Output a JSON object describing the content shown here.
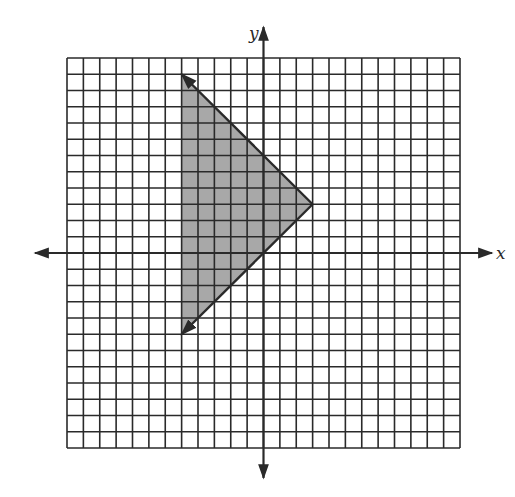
{
  "chart_data": {
    "type": "inequality-region",
    "title": "",
    "xlabel": "x",
    "ylabel": "y",
    "xlim": [
      -12,
      12
    ],
    "ylim": [
      -12,
      12
    ],
    "grid": true,
    "grid_step": 1,
    "tick_labels": false,
    "boundary_lines": [
      {
        "equation": "y = -x + 6",
        "slope": -1,
        "intercept": 6,
        "from": [
          -5,
          11
        ],
        "to": [
          3,
          3
        ],
        "style": "solid",
        "arrow_at": "from"
      },
      {
        "equation": "y = x",
        "slope": 1,
        "intercept": 0,
        "from": [
          -5,
          -5
        ],
        "to": [
          3,
          3
        ],
        "style": "solid",
        "arrow_at": "from"
      }
    ],
    "vertex": [
      3,
      3
    ],
    "shaded_region": {
      "polygon": [
        [
          -5,
          11
        ],
        [
          3,
          3
        ],
        [
          -5,
          -5
        ]
      ],
      "description": "y <= -x + 6 and y >= x, for x >= -5",
      "fill": "#a8a8a8"
    }
  },
  "axes": {
    "x_label": "x",
    "y_label": "y"
  },
  "colors": {
    "grid": "#2a2a2a",
    "axis": "#2a2a2a",
    "shade": "#a8a8a8",
    "background": "#ffffff"
  }
}
